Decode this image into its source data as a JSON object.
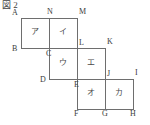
{
  "figure": {
    "caption": "図 2",
    "line_color": "#6e6e6e",
    "text_color": "#3a3a3a",
    "background": "#ffffff",
    "cell_size_px": 28,
    "vertices": [
      {
        "id": "A",
        "label": "A",
        "x": 21,
        "y": 18
      },
      {
        "id": "N",
        "label": "N",
        "x": 49,
        "y": 18
      },
      {
        "id": "M",
        "label": "M",
        "x": 77,
        "y": 18
      },
      {
        "id": "B",
        "label": "B",
        "x": 21,
        "y": 48
      },
      {
        "id": "C",
        "label": "C",
        "x": 49,
        "y": 48
      },
      {
        "id": "L",
        "label": "L",
        "x": 77,
        "y": 48
      },
      {
        "id": "K",
        "label": "K",
        "x": 105,
        "y": 48
      },
      {
        "id": "D",
        "label": "D",
        "x": 49,
        "y": 79
      },
      {
        "id": "E",
        "label": "E",
        "x": 77,
        "y": 79
      },
      {
        "id": "J",
        "label": "J",
        "x": 105,
        "y": 79
      },
      {
        "id": "I",
        "label": "I",
        "x": 133,
        "y": 79
      },
      {
        "id": "F",
        "label": "F",
        "x": 77,
        "y": 109
      },
      {
        "id": "G",
        "label": "G",
        "x": 105,
        "y": 109
      },
      {
        "id": "H",
        "label": "H",
        "x": 133,
        "y": 109
      }
    ],
    "cells": [
      {
        "id": "cell-a",
        "label": "ア",
        "x": 21,
        "y": 18,
        "w": 28,
        "h": 30
      },
      {
        "id": "cell-i",
        "label": "イ",
        "x": 49,
        "y": 18,
        "w": 28,
        "h": 30
      },
      {
        "id": "cell-u",
        "label": "ウ",
        "x": 49,
        "y": 48,
        "w": 28,
        "h": 31
      },
      {
        "id": "cell-e",
        "label": "エ",
        "x": 77,
        "y": 48,
        "w": 28,
        "h": 31
      },
      {
        "id": "cell-o",
        "label": "オ",
        "x": 77,
        "y": 79,
        "w": 28,
        "h": 30
      },
      {
        "id": "cell-ka",
        "label": "カ",
        "x": 105,
        "y": 79,
        "w": 28,
        "h": 30
      }
    ],
    "segments": [
      {
        "id": "seg-A-M",
        "type": "h",
        "x": 21,
        "y": 18,
        "len": 57
      },
      {
        "id": "seg-B-K",
        "type": "h",
        "x": 21,
        "y": 48,
        "len": 85
      },
      {
        "id": "seg-D-I",
        "type": "h",
        "x": 49,
        "y": 79,
        "len": 85
      },
      {
        "id": "seg-F-H",
        "type": "h",
        "x": 77,
        "y": 109,
        "len": 57
      },
      {
        "id": "seg-A-B",
        "type": "v",
        "x": 21,
        "y": 18,
        "len": 31
      },
      {
        "id": "seg-N-D",
        "type": "v",
        "x": 49,
        "y": 18,
        "len": 62
      },
      {
        "id": "seg-M-F",
        "type": "v",
        "x": 77,
        "y": 18,
        "len": 92
      },
      {
        "id": "seg-K-G",
        "type": "v",
        "x": 105,
        "y": 48,
        "len": 62
      },
      {
        "id": "seg-I-H",
        "type": "v",
        "x": 133,
        "y": 79,
        "len": 31
      }
    ]
  }
}
